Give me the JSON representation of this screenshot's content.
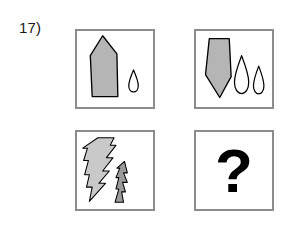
{
  "question": {
    "number_label": "17)"
  },
  "colors": {
    "panel_border": "#8c8c8c",
    "panel_background": "#ffffff",
    "shape_outline": "#000000",
    "gray_fill": "#b5b5b5",
    "light_gray_fill": "#c9c9c9",
    "dark_gray_fill": "#9a9a9a",
    "question_mark": "#000000"
  },
  "panels": {
    "top_left": {
      "name": "top-left-panel",
      "shapes": [
        {
          "kind": "pentagon-point-up",
          "fill": "gray",
          "size": "large"
        },
        {
          "kind": "teardrop",
          "fill": "white",
          "size": "small",
          "count": 1
        }
      ]
    },
    "top_right": {
      "name": "top-right-panel",
      "shapes": [
        {
          "kind": "pentagon-point-down",
          "fill": "gray",
          "size": "large"
        },
        {
          "kind": "teardrop",
          "fill": "white",
          "size": "medium",
          "count": 1
        },
        {
          "kind": "teardrop",
          "fill": "white",
          "size": "small",
          "count": 1
        }
      ]
    },
    "bottom_left": {
      "name": "bottom-left-panel",
      "shapes": [
        {
          "kind": "lightning-bolt",
          "fill": "light-gray",
          "size": "large"
        },
        {
          "kind": "lightning-sliver",
          "fill": "dark-gray",
          "size": "small"
        }
      ]
    },
    "bottom_right": {
      "name": "bottom-right-panel",
      "question_mark": "?"
    }
  }
}
